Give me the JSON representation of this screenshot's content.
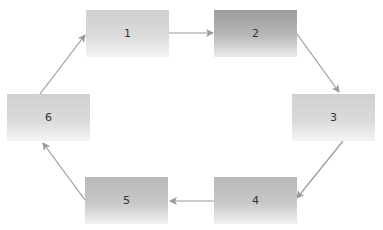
{
  "diagram": {
    "type": "cycle",
    "nodes": [
      {
        "id": "1",
        "label": "1"
      },
      {
        "id": "2",
        "label": "2"
      },
      {
        "id": "3",
        "label": "3"
      },
      {
        "id": "4",
        "label": "4"
      },
      {
        "id": "5",
        "label": "5"
      },
      {
        "id": "6",
        "label": "6"
      }
    ],
    "edges": [
      {
        "from": "1",
        "to": "2"
      },
      {
        "from": "2",
        "to": "3"
      },
      {
        "from": "3",
        "to": "4"
      },
      {
        "from": "4",
        "to": "5"
      },
      {
        "from": "5",
        "to": "6"
      },
      {
        "from": "6",
        "to": "1"
      }
    ],
    "colors": {
      "arrow": "#9a9a9a",
      "box_dark": "#9c9c9c",
      "box_light": "#d0d0d0",
      "text": "#333333"
    }
  }
}
